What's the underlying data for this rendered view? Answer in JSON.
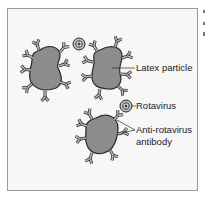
{
  "diagram": {
    "type": "latex agglutination schematic",
    "labels": {
      "latex_particle": "Latex particle",
      "rotavirus": "Rotavirus",
      "antibody_line1": "Anti-rotavirus",
      "antibody_line2": "antibody"
    },
    "colors": {
      "particle_fill": "#8c8c8c",
      "outline": "#2a2a2a",
      "antibody": "#9a9a9a",
      "background": "#f7f7f7",
      "frame": "#9a9a9a"
    },
    "elements": [
      {
        "kind": "latex-particle",
        "count": 3
      },
      {
        "kind": "rotavirus",
        "count": 2
      },
      {
        "kind": "anti-rotavirus-antibody",
        "note": "Y-shaped, many per particle"
      }
    ]
  }
}
